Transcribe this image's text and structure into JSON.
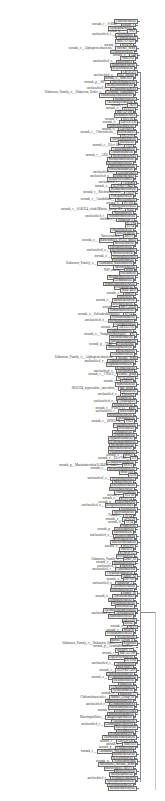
{
  "figure": {
    "type": "phylogenetic-tree",
    "orientation": "leaves-left, root-right",
    "colors": {
      "line": "#8a8a8a",
      "secondary_line": "#c8c8c8",
      "label_text": "#333333",
      "label_box_border": "#6d6d6d",
      "label_box_fill": "#f4f4f4"
    }
  },
  "leaves": [
    {
      "prefix": "",
      "box": "Chloroflexaceae"
    },
    {
      "prefix": "norank_c__S-BQ2",
      "box": "norank_o"
    },
    {
      "prefix": "",
      "box": "Tepidisphaeraceae"
    },
    {
      "prefix": "norank_p__",
      "box": "WS2"
    },
    {
      "prefix": "unclassified_c",
      "box": "Anaerolineae"
    },
    {
      "prefix": "",
      "box": "Caldilineaceae"
    },
    {
      "prefix": "",
      "box": "RBG-13-54-9"
    },
    {
      "prefix": "norank_c",
      "box": "KD4-96"
    },
    {
      "prefix": "norank_o__Alphaproteobacteria",
      "box": "Incertae_Sedis"
    },
    {
      "prefix": "",
      "box": "Geminicoccaceae"
    },
    {
      "prefix": "norank_o",
      "box": "A4b"
    },
    {
      "prefix": "",
      "box": "SBR1031"
    },
    {
      "prefix": "unclassified_o",
      "box": "Rhizobiales"
    },
    {
      "prefix": "",
      "box": "Xanthobacteraceae"
    },
    {
      "prefix": "",
      "box": "Beijerinckiaceae"
    },
    {
      "prefix": "",
      "box": "CK-2C2-2"
    },
    {
      "prefix": "unclassified_o",
      "box": "Pla3_lineage"
    },
    {
      "prefix": "",
      "box": "norank_o__SBR1031"
    },
    {
      "prefix": "norank_p__SR1",
      "box": "Absconditabacteria"
    },
    {
      "prefix": "",
      "box": "Methylomirabilaceae"
    },
    {
      "prefix": "unclassified_c",
      "box": "Gemmatimonadetes"
    },
    {
      "prefix": "Unknown_Family_o__Unknown_Order_c",
      "box": "Clostridia_vadinBB60"
    },
    {
      "prefix": "",
      "box": "Thermoanaerobaculaceae"
    },
    {
      "prefix": "",
      "box": "Sandaracinaceae"
    },
    {
      "prefix": "",
      "box": "Thermomicrobiaceae"
    },
    {
      "prefix": "norank_c",
      "box": "TK10"
    },
    {
      "prefix": "norank_o",
      "box": "PLTA13"
    },
    {
      "prefix": "",
      "box": "MB-A2-108"
    },
    {
      "prefix": "",
      "box": "Rokubacteriales"
    },
    {
      "prefix": "norank_c",
      "box": "SHA-26"
    },
    {
      "prefix": "norank_o",
      "box": "Gitt-GS-136"
    },
    {
      "prefix": "",
      "box": "Hydrogenophilaceae"
    },
    {
      "prefix": "norank_o",
      "box": "Gaiellales"
    },
    {
      "prefix": "norank_c__Chloroflexia",
      "box": "Kallotenuales"
    },
    {
      "prefix": "",
      "box": "TRA3-20"
    },
    {
      "prefix": "",
      "box": "Alicyclobacillaceae"
    },
    {
      "prefix": "",
      "box": "Bacillaceae"
    },
    {
      "prefix": "norank_c__Elev-16S",
      "box": "1332"
    },
    {
      "prefix": "",
      "box": "Chitinophagaceae"
    },
    {
      "prefix": "",
      "box": "Comamonadaceae"
    },
    {
      "prefix": "norank_c__AD3",
      "box": "Ktedonobacterales"
    },
    {
      "prefix": "",
      "box": "Ktedonobacteraceae"
    },
    {
      "prefix": "",
      "box": "Steroidobacteraceae"
    },
    {
      "prefix": "",
      "box": "Sphingobacteriaceae"
    },
    {
      "prefix": "",
      "box": "Nitrosomonadaceae"
    },
    {
      "prefix": "unclassified_o",
      "box": "Lactobacillales"
    },
    {
      "prefix": "unclassified_o",
      "box": "Burkholderiales"
    },
    {
      "prefix": "",
      "box": "Dehalococcoidales"
    },
    {
      "prefix": "unclassified_c",
      "box": "Clostridia"
    },
    {
      "prefix": "norank_c",
      "box": "JG30-KF-CM45"
    },
    {
      "prefix": "",
      "box": "Ktedonobacteraceae"
    },
    {
      "prefix": "norank_c__Ktedonobacteria",
      "box": "C0119"
    },
    {
      "prefix": "",
      "box": "Pedosphaeraceae"
    },
    {
      "prefix": "norank_c__Candidatus",
      "box": "Woesearchaeia"
    },
    {
      "prefix": "norank_c",
      "box": "P2-11E"
    },
    {
      "prefix": "",
      "box": "Chthoniobacteraceae"
    },
    {
      "prefix": "norank_c__SAR324_clade(Marine_group_B)",
      "box": "KS41"
    },
    {
      "prefix": "",
      "box": "Nitrospiraceae"
    },
    {
      "prefix": "unclassified_f",
      "box": "Solirubrobacteraceae"
    },
    {
      "prefix": "norank_c",
      "box": "Subgroup_6"
    },
    {
      "prefix": "",
      "box": "SC-I-84"
    },
    {
      "prefix": "",
      "box": "67-14"
    },
    {
      "prefix": "",
      "box": "Anaerolineaceae"
    },
    {
      "prefix": "",
      "box": "Roseiflexaceae"
    },
    {
      "prefix": "Bacteroidetes",
      "box": "BD2-2"
    },
    {
      "prefix": "norank_o",
      "box": "Bacteroidetes_VC2.1_Bac22"
    },
    {
      "prefix": "",
      "box": "Microscillaceae"
    },
    {
      "prefix": "",
      "box": "Flavobacteriaceae"
    },
    {
      "prefix": "unclassified_o",
      "box": "Saccharimonadales"
    },
    {
      "prefix": "",
      "box": "Micrococcaceae"
    },
    {
      "prefix": "norank_o",
      "box": "Vicinamibacterales"
    },
    {
      "prefix": "",
      "box": "Nocardioidaceae"
    },
    {
      "prefix": "Unknown_Family_o",
      "box": "Candidatus_Kaiserbacteria"
    },
    {
      "prefix": "",
      "box": "Microtrichaceae"
    },
    {
      "prefix": "NS9_marine",
      "box": "group"
    },
    {
      "prefix": "",
      "box": "Pirellulaceae"
    },
    {
      "prefix": "",
      "box": "Rhodanobacteraceae"
    },
    {
      "prefix": "",
      "box": "Gemmataceae"
    },
    {
      "prefix": "",
      "box": "Xiphinematobacteraceae"
    },
    {
      "prefix": "",
      "box": "Polyangiaceae"
    },
    {
      "prefix": "",
      "box": "MSB-4B10"
    },
    {
      "prefix": "norank_o",
      "box": "Blfdi19"
    },
    {
      "prefix": "",
      "box": "Halieaceae"
    },
    {
      "prefix": "norank_c",
      "box": "Blastocatellaceae"
    },
    {
      "prefix": "",
      "box": "Bryobacteraceae"
    },
    {
      "prefix": "norank_o",
      "box": "IMCC26256"
    },
    {
      "prefix": "",
      "box": "Ilumatobacteraceae"
    },
    {
      "prefix": "norank_o__Solirubrobacterales",
      "box": "67-14"
    },
    {
      "prefix": "",
      "box": "Pyrinomonadaceae"
    },
    {
      "prefix": "unclassified_o",
      "box": "Saccharimonadales"
    },
    {
      "prefix": "",
      "box": "Acetobacteraceae"
    },
    {
      "prefix": "norank_o",
      "box": "AKYG1722"
    },
    {
      "prefix": "",
      "box": "Longimicrobiaceae"
    },
    {
      "prefix": "norank_o__Vampirovibrionales",
      "box": "SC"
    },
    {
      "prefix": "",
      "box": "Rhodothermaceae"
    },
    {
      "prefix": "",
      "box": "Sphingomonadaceae"
    },
    {
      "prefix": "norank_p__TM6",
      "box": "Dependentiae"
    },
    {
      "prefix": "",
      "box": "Nitrososphaeraceae"
    },
    {
      "prefix": "",
      "box": "Rickettsiaceae"
    },
    {
      "prefix": "",
      "box": "Acetobacteraceae"
    },
    {
      "prefix": "Unknown_Family_o__Alphaproteobacteria",
      "box": "Incertae_Sedis"
    },
    {
      "prefix": "unclassified_o",
      "box": "Alphaproteobacteria"
    },
    {
      "prefix": "",
      "box": "Hyphomicrobiaceae"
    },
    {
      "prefix": "",
      "box": "Reyranellaceae"
    },
    {
      "prefix": "unclassified_f",
      "box": "Unclassified"
    },
    {
      "prefix": "norank_c__CPla-3",
      "box": "termite_group"
    },
    {
      "prefix": "",
      "box": "KF-JG30-B3"
    },
    {
      "prefix": "norank_c",
      "box": "SAR202"
    },
    {
      "prefix": "",
      "box": "Sumerlaeaceae"
    },
    {
      "prefix": "0832294_hypersaline_microbial",
      "box": "mat_group"
    },
    {
      "prefix": "",
      "box": "Opitutaceae"
    },
    {
      "prefix": "unclassified_o",
      "box": "Elsterales"
    },
    {
      "prefix": "",
      "box": "Dongiaceae"
    },
    {
      "prefix": "unclassified_o",
      "box": "Cytophagales"
    },
    {
      "prefix": "",
      "box": "Solibacteraceae"
    },
    {
      "prefix": "norank_c__S-Orc1-13",
      "box": "BSC"
    },
    {
      "prefix": "unclassified_c",
      "box": "Bacteroidia"
    },
    {
      "prefix": "",
      "box": "Methyloligellaceae"
    },
    {
      "prefix": "",
      "box": "Haliangiaceae"
    },
    {
      "prefix": "norank_c__OPB12-B",
      "box": "TNLP"
    },
    {
      "prefix": "",
      "box": "Caulobacteraceae"
    },
    {
      "prefix": "",
      "box": "Devosiaceae"
    },
    {
      "prefix": "",
      "box": "Archangiaceae"
    },
    {
      "prefix": "",
      "box": "Acidothermaceae"
    },
    {
      "prefix": "",
      "box": "Hyphomonadaceae"
    },
    {
      "prefix": "",
      "box": "Geodermatophilaceae"
    },
    {
      "prefix": "",
      "box": "Streptomycetaceae"
    },
    {
      "prefix": "",
      "box": "Mycobacteriaceae"
    },
    {
      "prefix": "",
      "box": "Pseudonocardiaceae"
    },
    {
      "prefix": "norank_o",
      "box": "MND1"
    },
    {
      "prefix": "norank_c__Elev-16S",
      "box": "573"
    },
    {
      "prefix": "",
      "box": "Gemmatimonadaceae"
    },
    {
      "prefix": "norank_p__Marinimicrobia(SAR406_clade)",
      "box": "WPS-2"
    },
    {
      "prefix": "norank_c",
      "box": "Methylacidiphilaceae"
    },
    {
      "prefix": "",
      "box": "MSB-1E8"
    },
    {
      "prefix": "",
      "box": "A21b"
    },
    {
      "prefix": "unclassified_o",
      "box": "Desulfobacterales"
    },
    {
      "prefix": "",
      "box": "Moraxellaceae"
    },
    {
      "prefix": "",
      "box": "Enterobacteriaceae"
    },
    {
      "prefix": "",
      "box": "Helicobacteraceae"
    },
    {
      "prefix": "",
      "box": "Nannocystaceae"
    },
    {
      "prefix": "norank_c",
      "box": "SJA-28"
    },
    {
      "prefix": "norank_o",
      "box": "RCP2-54"
    },
    {
      "prefix": "norank_p",
      "box": "Latescibacteria"
    },
    {
      "prefix": "unclassified_o",
      "box": "Betaproteobacteriales"
    },
    {
      "prefix": "",
      "box": "Erwiniaceae"
    },
    {
      "prefix": "",
      "box": "Sporichthyaceae"
    },
    {
      "prefix": "Family1",
      "box": "11-24"
    },
    {
      "prefix": "norank_o",
      "box": "AT-s3-28"
    },
    {
      "prefix": "norank_o",
      "box": "11-24"
    },
    {
      "prefix": "",
      "box": "Frankiaceae"
    },
    {
      "prefix": "norank_p",
      "box": "Latescibacteria"
    },
    {
      "prefix": "",
      "box": "Phormidiaceae"
    },
    {
      "prefix": "unclassified_o",
      "box": "Thermoleophilia"
    },
    {
      "prefix": "",
      "box": "Polyangiaceae"
    },
    {
      "prefix": "",
      "box": "Bdellovibrionaceae"
    },
    {
      "prefix": "norank_o",
      "box": "WD2101"
    },
    {
      "prefix": "",
      "box": "SM2D12"
    },
    {
      "prefix": "",
      "box": "KCM-B-112"
    },
    {
      "prefix": "",
      "box": "Pirellulaceae"
    },
    {
      "prefix": "Unknown_Family_o",
      "box": "Order_III"
    },
    {
      "prefix": "norank_o",
      "box": "Rhodospirillales"
    },
    {
      "prefix": "unclassified_o",
      "box": "Bacteria"
    },
    {
      "prefix": "unclassified_c",
      "box": "Cyanobacteriia"
    },
    {
      "prefix": "",
      "box": "Cryptosporangiaceae"
    },
    {
      "prefix": "",
      "box": "Family_XI"
    },
    {
      "prefix": "norank_o",
      "box": "DS-100"
    },
    {
      "prefix": "unclassified_o",
      "box": "Subgroup_2"
    },
    {
      "prefix": "",
      "box": "Cyclobacteriaceae"
    },
    {
      "prefix": "",
      "box": "Oxalobacteraceae"
    },
    {
      "prefix": "",
      "box": "Family_IX"
    },
    {
      "prefix": "norank_o",
      "box": "Ardenticatenales"
    },
    {
      "prefix": "",
      "box": "Acidobacteriaceae"
    },
    {
      "prefix": "",
      "box": "Microbacteriaceae"
    },
    {
      "prefix": "",
      "box": "Rhizobiaceae"
    },
    {
      "prefix": "",
      "box": "Thermoactinomycetaceae"
    },
    {
      "prefix": "unclassified_o",
      "box": "Actinobacteria"
    },
    {
      "prefix": "",
      "box": "Rhodobacteraceae"
    },
    {
      "prefix": "",
      "box": "TRA3-20"
    },
    {
      "prefix": "",
      "box": "BIrii41"
    },
    {
      "prefix": "norank_o",
      "box": "NB1-j"
    },
    {
      "prefix": "norank_c",
      "box": "KD4-96"
    },
    {
      "prefix": "",
      "box": "Vicinamibacteraceae"
    },
    {
      "prefix": "",
      "box": "Weeksellaceae"
    },
    {
      "prefix": "",
      "box": "Marine_Group_II"
    },
    {
      "prefix": "Unknown_Family_o__Unknown_Order_c",
      "box": "Kryptonia"
    },
    {
      "prefix": "norank_p__Armatimonadetes",
      "box": ""
    },
    {
      "prefix": "",
      "box": "env.OPS_17"
    },
    {
      "prefix": "norank_c",
      "box": "MB-A2-108"
    },
    {
      "prefix": "",
      "box": "Diplorickettsiaceae"
    },
    {
      "prefix": "",
      "box": "DEV008"
    },
    {
      "prefix": "unclassified_c",
      "box": "Actinobacteria"
    },
    {
      "prefix": "",
      "box": "bacteriap25"
    },
    {
      "prefix": "norank_c",
      "box": "JG30-KF-AS9"
    },
    {
      "prefix": "",
      "box": "Chthonomonadaceae"
    },
    {
      "prefix": "norank_o",
      "box": "Gemmatimonadaceae"
    },
    {
      "prefix": "",
      "box": "Paenibacillaceae"
    },
    {
      "prefix": "",
      "box": "Iamiaceae"
    },
    {
      "prefix": "",
      "box": "Cellulomonadaceae"
    },
    {
      "prefix": "",
      "box": "Solimonadaceae"
    },
    {
      "prefix": "norank_o",
      "box": "Subgroup_17"
    },
    {
      "prefix": "Chthoniobacterales",
      "box": "Marine_Group_III"
    },
    {
      "prefix": "",
      "box": "Sphingomonadaceae"
    },
    {
      "prefix": "unclassified_o",
      "box": "Gemmatimonadetes"
    },
    {
      "prefix": "",
      "box": "Parachlamydiaceae"
    },
    {
      "prefix": "norank_c",
      "box": "Dehalococcoidia"
    },
    {
      "prefix": "",
      "box": "Sphingomonadaceae"
    },
    {
      "prefix": "Rhodospirillales",
      "box": "Magnetospirillaceae"
    },
    {
      "prefix": "",
      "box": "Catenulisporaceae"
    },
    {
      "prefix": "unclassified_c",
      "box": "Gammaproteobacteria"
    },
    {
      "prefix": "",
      "box": "Kineosporiaceae"
    },
    {
      "prefix": "",
      "box": "Nocardiaceae"
    },
    {
      "prefix": "",
      "box": "Dermatophilaceae"
    },
    {
      "prefix": "",
      "box": "Thermoanaerobaculaceae"
    },
    {
      "prefix": "norank_c",
      "box": "Gitt-GS-136"
    },
    {
      "prefix": "norank_o",
      "box": "SBR1031"
    },
    {
      "prefix": "norank_p",
      "box": "Elusimicrobia"
    },
    {
      "prefix": "norank_c",
      "box": "Candidatus_Woesebacteria"
    },
    {
      "prefix": "",
      "box": "Burkholderiaceae"
    },
    {
      "prefix": "",
      "box": "Beijerinckiaceae"
    },
    {
      "prefix": "norank_p",
      "box": "Verrucomicrobiae"
    },
    {
      "prefix": "",
      "box": "Rhizobiales_Incertae_Sedis"
    },
    {
      "prefix": "",
      "box": "Bacteroidetes_BD2-2"
    },
    {
      "prefix": "",
      "box": "Myxococcaceae"
    },
    {
      "prefix": "",
      "box": "Methylophilaceae"
    },
    {
      "prefix": "unclassified_c",
      "box": "Deltaproteobacteria"
    },
    {
      "prefix": "",
      "box": "Syntrophobacteraceae"
    },
    {
      "prefix": "",
      "box": "Pyrinomonadaceae"
    },
    {
      "prefix": "",
      "box": "Ktedonobacteraceae"
    }
  ],
  "branches": {
    "main_trunk": {
      "x": 140,
      "y_top": 72,
      "y_bottom": 782
    },
    "root_connector": {
      "y": 612,
      "x_from": 140,
      "x_to": 155
    },
    "root_stem": {
      "x": 155,
      "y_top": 612,
      "y_bottom": 790
    }
  }
}
